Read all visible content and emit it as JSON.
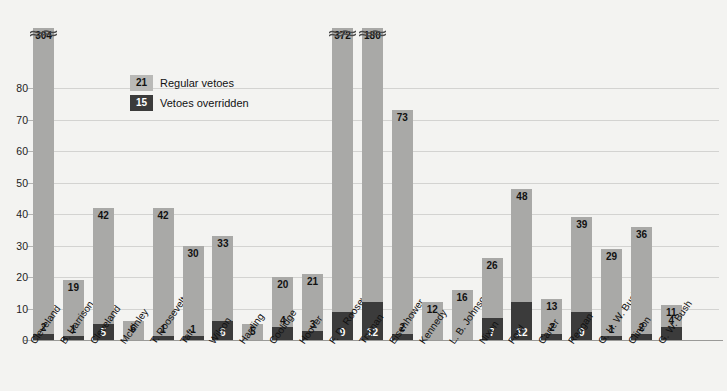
{
  "chart_data": {
    "type": "bar",
    "subtype": "stacked",
    "title": "",
    "xlabel": "",
    "ylabel": "",
    "ylim": [
      0,
      88
    ],
    "yticks": [
      0,
      10,
      20,
      30,
      40,
      50,
      60,
      70,
      80
    ],
    "grid": true,
    "legend_position": "inside-top-left",
    "categories": [
      "Cleveland",
      "B. Harrison",
      "Cleveland",
      "McKinley",
      "T. Roosevelt",
      "Taft",
      "Wilson",
      "Harding",
      "Coolidge",
      "Hoover",
      "F. D. Roosevelt",
      "Truman",
      "Eisenhower",
      "Kennedy",
      "L. B. Johnson",
      "Nixon",
      "Ford",
      "Carter",
      "Reagan",
      "G. H. W. Bush",
      "Clinton",
      "G. W. Bush"
    ],
    "series": [
      {
        "name": "Regular vetoes",
        "color": "#a9a9a7",
        "values": [
          304,
          19,
          42,
          6,
          42,
          30,
          33,
          5,
          20,
          21,
          372,
          180,
          73,
          12,
          16,
          26,
          48,
          13,
          39,
          29,
          36,
          11
        ]
      },
      {
        "name": "Vetoes overridden",
        "color": "#3b3b3b",
        "values": [
          2,
          1,
          5,
          0,
          1,
          1,
          6,
          0,
          4,
          3,
          9,
          12,
          2,
          0,
          0,
          7,
          12,
          2,
          9,
          1,
          2,
          4
        ]
      }
    ],
    "truncated_bars": [
      {
        "category": "Cleveland",
        "value": 304
      },
      {
        "category": "F. D. Roosevelt",
        "value": 372
      },
      {
        "category": "Truman",
        "value": 180
      }
    ]
  },
  "legend": {
    "items": [
      {
        "swatch_value": "21",
        "label": "Regular vetoes"
      },
      {
        "swatch_value": "15",
        "label": "Vetoes overridden"
      }
    ]
  },
  "colors": {
    "regular": "#a9a9a7",
    "overridden": "#3b3b3b",
    "background": "#f3f3f1",
    "gridline": "#d3d3d1",
    "axis": "#9a9a98"
  }
}
